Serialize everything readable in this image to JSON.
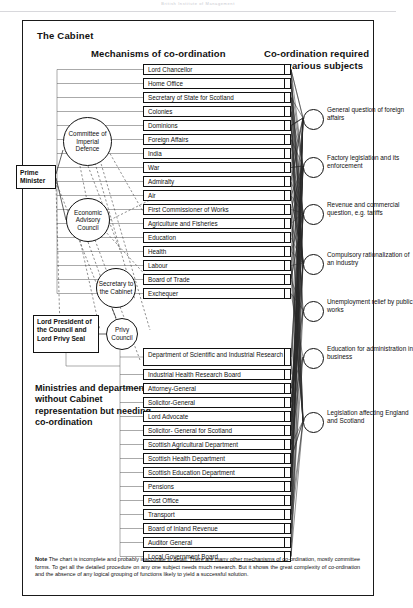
{
  "page": {
    "faint_header": "British Institute of Management",
    "frame_title": "The Cabinet",
    "column_headings": {
      "left": "Mechanisms of co-ordination",
      "right_line1": "Co-ordination required",
      "right_line2": "on various subjects"
    },
    "ministries_caption": "Ministries and departments without Cabinet representation but needing co-ordination",
    "note_label": "Note",
    "note_text": "The chart is incomplete and probably inaccurate in detail. There are many other mechanisms of co-ordination, mostly committee forms. To get all the detailed procedure on any one subject needs much research. But it shows the great complexity of co-ordination and the absence of any logical grouping of functions likely to yield a successful solution."
  },
  "mechanisms": [
    {
      "id": "prime-minister",
      "label": "Prime Minister",
      "shape": "box"
    },
    {
      "id": "committee-of-imperial-defence",
      "label": "Committee of Imperial Defence",
      "shape": "circle"
    },
    {
      "id": "economic-advisory-council",
      "label": "Economic Advisory Council",
      "shape": "circle"
    },
    {
      "id": "secretary-to-the-cabinet",
      "label": "Secretary to the Cabinet",
      "shape": "circle"
    },
    {
      "id": "lord-president",
      "label": "Lord President of the Council and Lord Privy Seal",
      "shape": "box"
    },
    {
      "id": "privy-council",
      "label": "Privy Council",
      "shape": "circle"
    }
  ],
  "cabinet_departments": [
    "Lord Chancellor",
    "Home Office",
    "Secretary of State for Scotland",
    "Colonies",
    "Dominions",
    "Foreign Affairs",
    "India",
    "War",
    "Admiralty",
    "Air",
    "First Commissioner of Works",
    "Agriculture and Fisheries",
    "Education",
    "Health",
    "Labour",
    "Board of Trade",
    "Exchequer"
  ],
  "non_cabinet_departments": [
    "Department of Scientific and Industrial Research",
    "Industrial Health Research Board",
    "Attorney-General",
    "Solicitor-General",
    "Lord Advocate",
    "Solicitor- General for Scotland",
    "Scottish Agricultural Department",
    "Scottish Health Department",
    "Scottish Education Department",
    "Pensions",
    "Post Office",
    "Transport",
    "Board of Inland Revenue",
    "Auditor General",
    "Local Government Board"
  ],
  "subjects": [
    "General question of foreign affairs",
    "Factory legislation and its enforcement",
    "Revenue and commercial question, e.g. tariffs",
    "Compulsory rationalization of an industry",
    "Unemployment relief by public works",
    "Education for administration in business",
    "Legislation affecting England and Scotland"
  ],
  "chart_data": {
    "type": "diagram",
    "title": "The Cabinet"
  }
}
